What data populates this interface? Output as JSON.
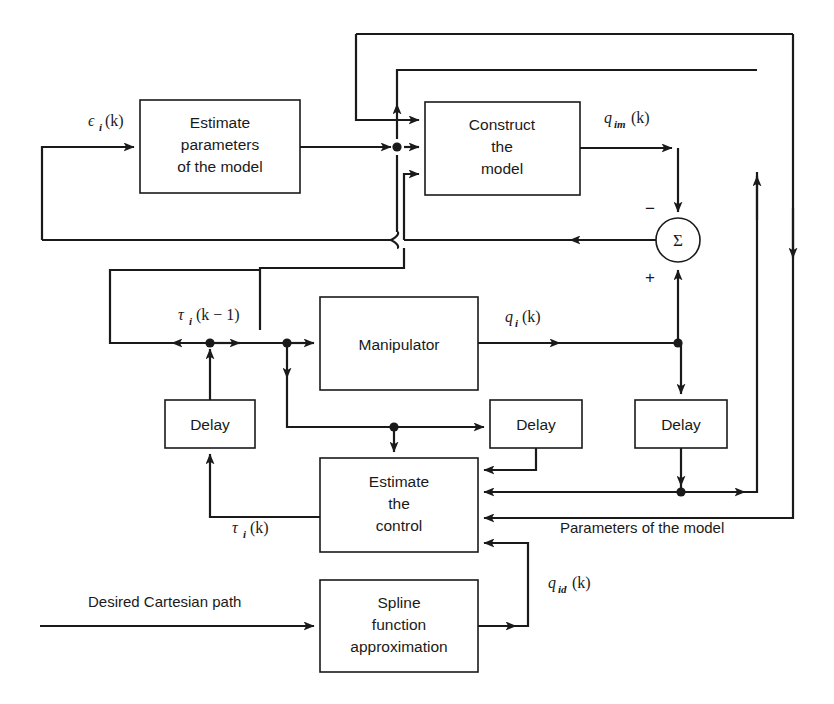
{
  "diagram": {
    "background_color": "#ffffff",
    "line_color": "#1a1a1a"
  },
  "blocks": [
    {
      "id": "estimate_parameters",
      "lines": [
        "Estimate",
        "parameters",
        "of the model"
      ],
      "x": 140,
      "y": 100,
      "w": 160,
      "h": 93
    },
    {
      "id": "construct_model",
      "lines": [
        "Construct",
        "the",
        "model"
      ],
      "x": 425,
      "y": 102,
      "w": 155,
      "h": 93
    },
    {
      "id": "manipulator",
      "lines": [
        "Manipulator"
      ],
      "x": 320,
      "y": 297,
      "w": 158,
      "h": 93
    },
    {
      "id": "delay_left",
      "lines": [
        "Delay"
      ],
      "x": 165,
      "y": 400,
      "w": 90,
      "h": 48
    },
    {
      "id": "delay_mid",
      "lines": [
        "Delay"
      ],
      "x": 490,
      "y": 400,
      "w": 92,
      "h": 48
    },
    {
      "id": "delay_right",
      "lines": [
        "Delay"
      ],
      "x": 635,
      "y": 400,
      "w": 92,
      "h": 48
    },
    {
      "id": "estimate_control",
      "lines": [
        "Estimate",
        "the",
        "control"
      ],
      "x": 320,
      "y": 458,
      "w": 158,
      "h": 94
    },
    {
      "id": "spline",
      "lines": [
        "Spline",
        "function",
        "approximation"
      ],
      "x": 320,
      "y": 580,
      "w": 158,
      "h": 92
    }
  ],
  "summing_junction": {
    "id": "sum_node",
    "symbol": "Σ",
    "cx": 678,
    "cy": 240,
    "r": 22,
    "minus_sign": "−",
    "plus_sign": "+"
  },
  "signal_labels": [
    {
      "id": "epsilon_i_k",
      "base": "ϵ",
      "sub": "i",
      "suffix": "(k)",
      "x": 88,
      "y": 126,
      "type": "math"
    },
    {
      "id": "q_im_k",
      "base": "q",
      "sub": "im",
      "suffix": "(k)",
      "x": 604,
      "y": 123,
      "type": "math"
    },
    {
      "id": "tau_i_k_minus_1",
      "base": "τ",
      "sub": "i",
      "suffix": "(k − 1)",
      "x": 178,
      "y": 320,
      "type": "math"
    },
    {
      "id": "q_i_k",
      "base": "q",
      "sub": "i",
      "suffix": "(k)",
      "x": 505,
      "y": 322,
      "type": "math"
    },
    {
      "id": "tau_i_k",
      "base": "τ",
      "sub": "i",
      "suffix": "(k)",
      "x": 232,
      "y": 533,
      "type": "math"
    },
    {
      "id": "q_id_k",
      "base": "q",
      "sub": "id",
      "suffix": "(k)",
      "x": 548,
      "y": 588,
      "type": "math"
    }
  ],
  "text_labels": [
    {
      "id": "desired_cartesian_path",
      "text": "Desired Cartesian path",
      "x": 88,
      "y": 607
    },
    {
      "id": "parameters_of_the_model",
      "text": "Parameters of the model",
      "x": 560,
      "y": 533
    }
  ]
}
